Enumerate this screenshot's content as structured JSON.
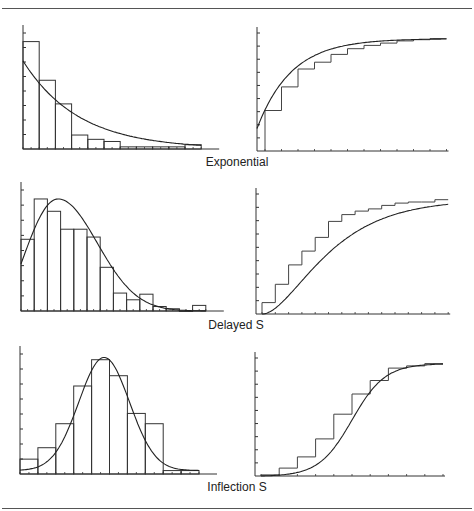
{
  "figure": {
    "captions": [
      "Exponential",
      "Delayed S",
      "Inflection S"
    ]
  },
  "chart_data": [
    {
      "type": "bar",
      "title": "Exponential",
      "panel": "histogram-pdf",
      "categories": [
        "1",
        "2",
        "3",
        "4",
        "5",
        "6",
        "7",
        "8",
        "9",
        "10",
        "11"
      ],
      "values": [
        1.0,
        0.64,
        0.42,
        0.13,
        0.09,
        0.07,
        0.02,
        0.02,
        0.02,
        0.02,
        0.04
      ],
      "fit_curve": "exponential-density",
      "xlabel": "",
      "ylabel": "",
      "ylim": [
        0,
        1.08
      ],
      "grid": false,
      "frame": {
        "x0": 23,
        "y0": 149,
        "barw": 16.2,
        "h": 116
      }
    },
    {
      "type": "line",
      "title": "Exponential",
      "panel": "cdf-step",
      "x": [
        1,
        2,
        3,
        4,
        5,
        6,
        7,
        8,
        9,
        10,
        11
      ],
      "values": [
        0.36,
        0.57,
        0.73,
        0.79,
        0.86,
        0.91,
        0.94,
        0.96,
        0.98,
        0.99,
        1.0
      ],
      "fit_curve": "exponential-cdf",
      "ylim": [
        0,
        1.05
      ],
      "grid": false,
      "frame": {
        "x0": 257,
        "y0": 151,
        "step": 16.5,
        "h": 118,
        "xoff": 8
      }
    },
    {
      "type": "bar",
      "title": "Delayed S",
      "panel": "histogram-pdf",
      "categories": [
        "1",
        "2",
        "3",
        "4",
        "5",
        "6",
        "7",
        "8",
        "9",
        "10",
        "11",
        "12",
        "13",
        "14"
      ],
      "values": [
        0.64,
        1.0,
        0.89,
        0.73,
        0.73,
        0.66,
        0.39,
        0.16,
        0.1,
        0.15,
        0.04,
        0.02,
        0.0,
        0.05
      ],
      "fit_curve": "delayed-s-density",
      "ylim": [
        0,
        1.08
      ],
      "grid": false,
      "frame": {
        "x0": 21,
        "y0": 311,
        "barw": 13.2,
        "h": 121
      }
    },
    {
      "type": "line",
      "title": "Delayed S",
      "panel": "cdf-step",
      "x": [
        1,
        2,
        3,
        4,
        5,
        6,
        7,
        8,
        9,
        10,
        11,
        12,
        13,
        14
      ],
      "values": [
        0.1,
        0.26,
        0.43,
        0.55,
        0.67,
        0.81,
        0.87,
        0.9,
        0.92,
        0.95,
        0.97,
        0.98,
        0.98,
        1.0
      ],
      "fit_curve": "delayed-s-cdf",
      "ylim": [
        0,
        1.05
      ],
      "grid": false,
      "frame": {
        "x0": 256,
        "y0": 314,
        "step": 13.3,
        "h": 120,
        "xoff": 6
      }
    },
    {
      "type": "bar",
      "title": "Inflection S",
      "panel": "histogram-pdf",
      "categories": [
        "1",
        "2",
        "3",
        "4",
        "5",
        "6",
        "7",
        "8",
        "9",
        "10"
      ],
      "values": [
        0.13,
        0.23,
        0.44,
        0.77,
        1.0,
        0.86,
        0.53,
        0.44,
        0.03,
        0.03
      ],
      "fit_curve": "inflection-s-density",
      "ylim": [
        0,
        1.05
      ],
      "grid": false,
      "frame": {
        "x0": 20,
        "y0": 474,
        "barw": 17.9,
        "h": 120
      }
    },
    {
      "type": "line",
      "title": "Inflection S",
      "panel": "cdf-step",
      "x": [
        1,
        2,
        3,
        4,
        5,
        6,
        7,
        8,
        9,
        10
      ],
      "values": [
        0.01,
        0.07,
        0.17,
        0.33,
        0.55,
        0.73,
        0.85,
        0.96,
        0.98,
        1.0
      ],
      "fit_curve": "inflection-s-cdf",
      "ylim": [
        0,
        1.05
      ],
      "grid": false,
      "frame": {
        "x0": 255,
        "y0": 476,
        "step": 18.2,
        "h": 118,
        "xoff": 6
      }
    }
  ]
}
